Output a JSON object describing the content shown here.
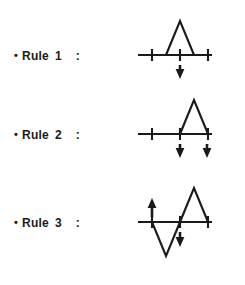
{
  "figure": {
    "title": "",
    "background_color": "#ffffff",
    "ink_color": "#1a1a1a",
    "rules": [
      {
        "bullet": "•",
        "name": "Rule",
        "number": "1",
        "separator": ":",
        "label_text": "• Rule 1 :",
        "diagram": {
          "type": "waveform-with-markers",
          "axis": {
            "x_start": 8,
            "x_end": 82,
            "y": 45
          },
          "ticks": [
            22,
            50,
            78
          ],
          "waveform_points": "36,45 50,11 64,45",
          "arrows": [
            {
              "direction": "down",
              "x": 50,
              "tail_y": 52,
              "tip_y": 66
            }
          ]
        }
      },
      {
        "bullet": "•",
        "name": "Rule",
        "number": "2",
        "separator": ":",
        "label_text": "• Rule 2 :",
        "diagram": {
          "type": "waveform-with-markers",
          "axis": {
            "x_start": 8,
            "x_end": 82,
            "y": 45
          },
          "ticks": [
            22,
            50,
            78
          ],
          "waveform_points": "50,45 64,11 78,45",
          "arrows": [
            {
              "direction": "down",
              "x": 50,
              "tail_y": 52,
              "tip_y": 66
            },
            {
              "direction": "down",
              "x": 77,
              "tail_y": 52,
              "tip_y": 66
            }
          ]
        }
      },
      {
        "bullet": "•",
        "name": "Rule",
        "number": "3",
        "separator": ":",
        "label_text": "• Rule 3 :",
        "diagram": {
          "type": "waveform-with-markers",
          "axis": {
            "x_start": 8,
            "x_end": 82,
            "y": 45
          },
          "ticks": [
            22,
            50,
            78
          ],
          "waveform_points": "22,45 36,79 50,45 64,11 78,45",
          "arrows": [
            {
              "direction": "up",
              "x": 22,
              "tail_y": 40,
              "tip_y": 22
            },
            {
              "direction": "down",
              "x": 50,
              "tail_y": 52,
              "tip_y": 68
            }
          ]
        }
      }
    ]
  }
}
